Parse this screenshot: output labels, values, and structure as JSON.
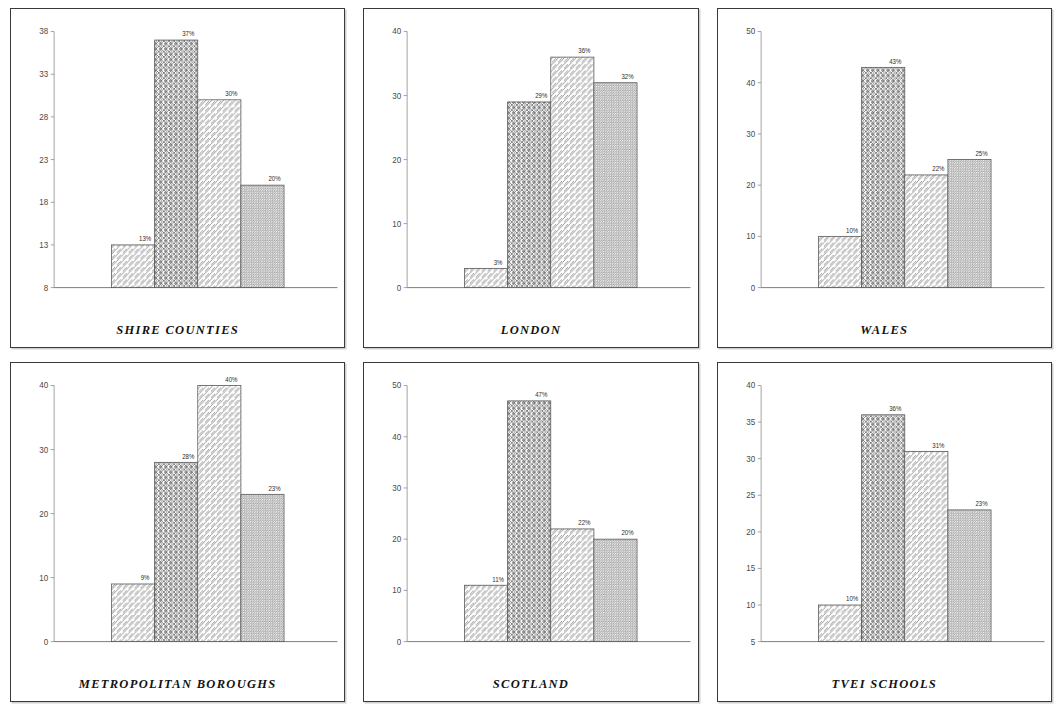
{
  "figure": {
    "panel_count": 6,
    "bar_labels_suffix": "%"
  },
  "chart_data": [
    {
      "type": "bar",
      "title": "SHIRE COUNTIES",
      "categories": [
        "1",
        "2",
        "3",
        "4"
      ],
      "values": [
        13,
        37,
        30,
        20
      ],
      "value_labels": [
        "13%",
        "37%",
        "30%",
        "20%"
      ],
      "xlabel": "",
      "ylabel": "",
      "ylim": [
        8,
        38
      ],
      "yticks": [
        8,
        13,
        18,
        23,
        28,
        33,
        38
      ],
      "ytick_labels": [
        "8",
        "13",
        "18",
        "23",
        "28",
        "33",
        "38"
      ],
      "grid": false,
      "legend": "none"
    },
    {
      "type": "bar",
      "title": "LONDON",
      "categories": [
        "1",
        "2",
        "3",
        "4"
      ],
      "values": [
        3,
        29,
        36,
        32
      ],
      "value_labels": [
        "3%",
        "29%",
        "36%",
        "32%"
      ],
      "xlabel": "",
      "ylabel": "",
      "ylim": [
        0,
        40
      ],
      "yticks": [
        0,
        10,
        20,
        30,
        40
      ],
      "ytick_labels": [
        "0",
        "10",
        "20",
        "30",
        "40"
      ],
      "grid": false,
      "legend": "none"
    },
    {
      "type": "bar",
      "title": "WALES",
      "categories": [
        "1",
        "2",
        "3",
        "4"
      ],
      "values": [
        10,
        43,
        22,
        25
      ],
      "value_labels": [
        "10%",
        "43%",
        "22%",
        "25%"
      ],
      "xlabel": "",
      "ylabel": "",
      "ylim": [
        0,
        50
      ],
      "yticks": [
        0,
        10,
        20,
        30,
        40,
        50
      ],
      "ytick_labels": [
        "0",
        "10",
        "20",
        "30",
        "40",
        "50"
      ],
      "grid": false,
      "legend": "none"
    },
    {
      "type": "bar",
      "title": "METROPOLITAN BOROUGHS",
      "categories": [
        "1",
        "2",
        "3",
        "4"
      ],
      "values": [
        9,
        28,
        40,
        23
      ],
      "value_labels": [
        "9%",
        "28%",
        "40%",
        "23%"
      ],
      "xlabel": "",
      "ylabel": "",
      "ylim": [
        0,
        40
      ],
      "yticks": [
        0,
        10,
        20,
        30,
        40
      ],
      "ytick_labels": [
        "0",
        "10",
        "20",
        "30",
        "40"
      ],
      "grid": false,
      "legend": "none"
    },
    {
      "type": "bar",
      "title": "SCOTLAND",
      "categories": [
        "1",
        "2",
        "3",
        "4"
      ],
      "values": [
        11,
        47,
        22,
        20
      ],
      "value_labels": [
        "11%",
        "47%",
        "22%",
        "20%"
      ],
      "xlabel": "",
      "ylabel": "",
      "ylim": [
        0,
        50
      ],
      "yticks": [
        0,
        10,
        20,
        30,
        40,
        50
      ],
      "ytick_labels": [
        "0",
        "10",
        "20",
        "30",
        "40",
        "50"
      ],
      "grid": false,
      "legend": "none"
    },
    {
      "type": "bar",
      "title": "TVEI SCHOOLS",
      "categories": [
        "1",
        "2",
        "3",
        "4"
      ],
      "values": [
        10,
        36,
        31,
        23
      ],
      "value_labels": [
        "10%",
        "36%",
        "31%",
        "23%"
      ],
      "xlabel": "",
      "ylabel": "",
      "ylim": [
        5,
        40
      ],
      "yticks": [
        5,
        10,
        15,
        20,
        25,
        30,
        35,
        40
      ],
      "ytick_labels": [
        "5",
        "10",
        "15",
        "20",
        "25",
        "30",
        "35",
        "40"
      ],
      "grid": false,
      "legend": "none"
    }
  ],
  "styles": {
    "bar_patterns": [
      "diagonal-hatch",
      "cross-hatch",
      "diagonal-hatch",
      "fine-dense-hatch"
    ],
    "panel_border_color": "#3a3a3a",
    "axis_color": "#8d8d8d",
    "bar_outline_color": "#5a5a5a",
    "background_color": "#ffffff",
    "text_color": "#121212"
  }
}
